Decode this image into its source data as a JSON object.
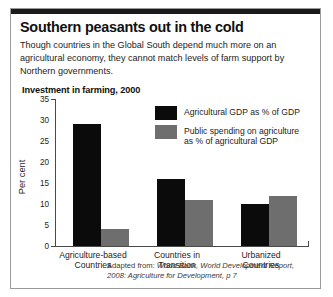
{
  "headline": "Southern peasants out in the cold",
  "standfirst": "Though countries in the Global South depend much more on an agricultural economy, they cannot match levels of farm support by Northern governments.",
  "chart_title": "Investment in farming, 2000",
  "source": {
    "prefix": "Adapted from:",
    "text": "World Bank, World Development Report, 2008: Agriculture for Development, p 7"
  },
  "chart_data": {
    "type": "bar",
    "title": "Investment in farming, 2000",
    "xlabel": "",
    "ylabel": "Per cent",
    "ylim": [
      0,
      35
    ],
    "yticks": [
      0,
      5,
      10,
      15,
      20,
      25,
      30,
      35
    ],
    "grid": false,
    "legend_position": "inside-top-right",
    "categories": [
      "Agriculture-based Countries",
      "Countries in Transition",
      "Urbanized Countries"
    ],
    "category_lines": [
      [
        "Agriculture-based",
        "Countries"
      ],
      [
        "Countries in",
        "Transition"
      ],
      [
        "Urbanized",
        "Countries"
      ]
    ],
    "series": [
      {
        "name": "Agricultural GDP as % of GDP",
        "name_lines": [
          "Agricultural GDP as % of GDP"
        ],
        "color": "#0b0b0b",
        "values": [
          29,
          16,
          10
        ]
      },
      {
        "name": "Public spending on agriculture as % of agricultural GDP",
        "name_lines": [
          "Public spending on agriculture",
          "as % of agricultural GDP"
        ],
        "color": "#6e6e6e",
        "values": [
          4,
          11,
          12
        ]
      }
    ]
  },
  "ticks": {
    "t0": "0",
    "t5": "5",
    "t10": "10",
    "t15": "15",
    "t20": "20",
    "t25": "25",
    "t30": "30",
    "t35": "35"
  }
}
